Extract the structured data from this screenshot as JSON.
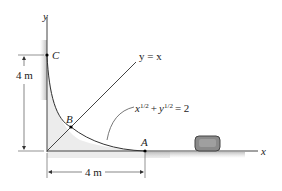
{
  "diagram": {
    "axes": {
      "x_label": "x",
      "y_label": "y"
    },
    "points": [
      {
        "name": "C",
        "coords_m": [
          0,
          4
        ]
      },
      {
        "name": "B",
        "coords_m": [
          1,
          1
        ]
      },
      {
        "name": "A",
        "coords_m": [
          4,
          0
        ]
      }
    ],
    "line_label": "y = x",
    "curve_label": {
      "base_x": "x",
      "exp": "1/2",
      "plus": "+",
      "base_y": "y",
      "eq": "= 2"
    },
    "dimensions": {
      "vertical": "4 m",
      "horizontal": "4 m"
    },
    "object": "crate-on-ground",
    "colors": {
      "line": "#333333",
      "shading": "#b8b8b8",
      "crate": "#7a7a7a"
    }
  }
}
